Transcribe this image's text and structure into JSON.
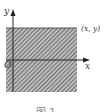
{
  "figure": {
    "axes": {
      "x_label": "x",
      "y_label": "y",
      "origin_label": "O"
    },
    "region": {
      "description": "shaded rectangular region",
      "corner_label": "(x, y)",
      "hatch_color": "#555555"
    },
    "caption": "图 1"
  }
}
